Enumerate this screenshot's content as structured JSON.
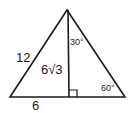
{
  "diagram": {
    "type": "30-60-90 triangle with altitude",
    "labels": {
      "hypotenuse": "12",
      "altitude": "6√3",
      "base_segment": "6",
      "apex_angle": "30°",
      "base_angle": "60°"
    },
    "colors": {
      "stroke": "#1a1a1a",
      "background": "#ffffff"
    }
  }
}
